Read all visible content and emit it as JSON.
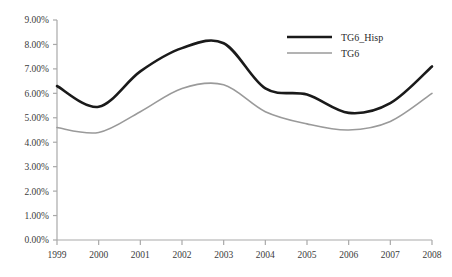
{
  "chart_data": {
    "type": "line",
    "title": "",
    "subtitle": "",
    "xlabel": "",
    "ylabel": "",
    "x": [
      "1999",
      "2000",
      "2001",
      "2002",
      "2003",
      "2004",
      "2005",
      "2006",
      "2007",
      "2008"
    ],
    "categories": [
      "1999",
      "2000",
      "2001",
      "2002",
      "2003",
      "2004",
      "2005",
      "2006",
      "2007",
      "2008"
    ],
    "series": [
      {
        "name": "TG6_Hisp",
        "color": "#1a1a1a",
        "line_width": 2.6,
        "values": [
          6.3,
          5.45,
          6.9,
          7.85,
          8.05,
          6.2,
          5.95,
          5.2,
          5.6,
          7.1
        ]
      },
      {
        "name": "TG6",
        "color": "#9a9a9a",
        "line_width": 1.6,
        "values": [
          4.6,
          4.4,
          5.25,
          6.2,
          6.35,
          5.25,
          4.75,
          4.5,
          4.85,
          6.0
        ]
      }
    ],
    "ylim": [
      0,
      9
    ],
    "ytick_step": 1,
    "ytick_labels": [
      "0.00%",
      "1.00%",
      "2.00%",
      "3.00%",
      "4.00%",
      "5.00%",
      "6.00%",
      "7.00%",
      "8.00%",
      "9.00%"
    ],
    "xtick_labels": [
      "1999",
      "2000",
      "2001",
      "2002",
      "2003",
      "2004",
      "2005",
      "2006",
      "2007",
      "2008"
    ],
    "grid": false,
    "legend_position": "inside-top-right",
    "axis_color": "#a9a9a9",
    "background_color": "#ffffff",
    "units": "percent"
  },
  "legend": {
    "entries": [
      {
        "label": "TG6_Hisp",
        "color": "#1a1a1a"
      },
      {
        "label": "TG6",
        "color": "#9a9a9a"
      }
    ]
  }
}
